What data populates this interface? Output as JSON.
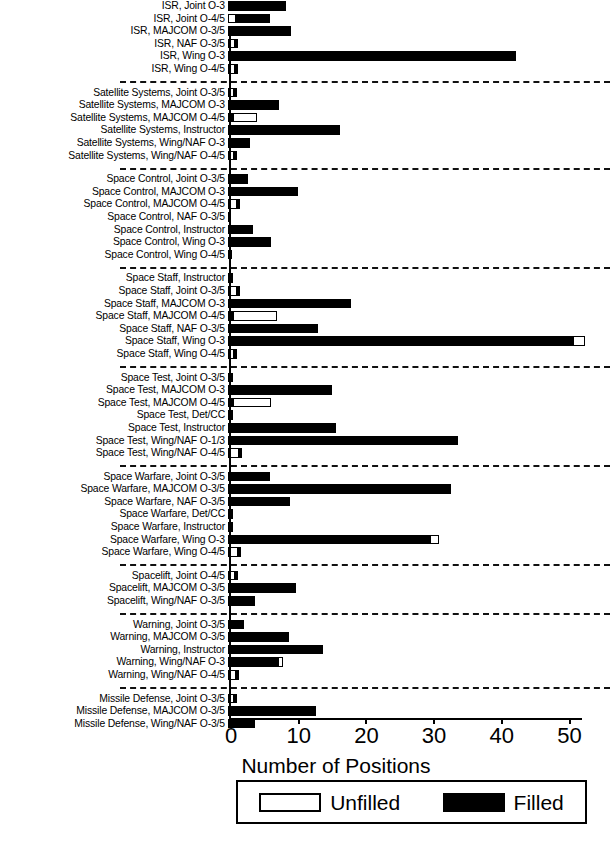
{
  "chart_data": {
    "type": "bar",
    "orientation": "horizontal",
    "stacked": true,
    "title": "",
    "xlabel": "Number of Positions",
    "ylabel": "",
    "xlim": [
      0,
      52
    ],
    "xticks": [
      0,
      10,
      20,
      30,
      40,
      50
    ],
    "xticklabels": [
      "0",
      "10",
      "20",
      "30",
      "40",
      "50"
    ],
    "grid": false,
    "legend": {
      "position": "bottom",
      "entries": [
        {
          "label": "Unfilled",
          "style": "unfilled",
          "color": "#ffffff",
          "edge": "#000000"
        },
        {
          "label": "Filled",
          "style": "filled",
          "color": "#000000",
          "edge": "#000000"
        }
      ]
    },
    "series": [
      {
        "name": "Unfilled",
        "style": "unfilled"
      },
      {
        "name": "Filled",
        "style": "filled"
      }
    ],
    "groups": [
      {
        "name": "ISR",
        "rows": [
          {
            "label": "ISR, Joint O-3",
            "unfilled": 0,
            "filled": 8.5
          },
          {
            "label": "ISR, Joint O-4/5",
            "unfilled": 1.2,
            "filled": 5.0
          },
          {
            "label": "ISR, MAJCOM O-3/5",
            "unfilled": 0,
            "filled": 9.3
          },
          {
            "label": "ISR, NAF O-3/5",
            "unfilled": 1.0,
            "filled": 0.5
          },
          {
            "label": "ISR, Wing O-3",
            "unfilled": 0,
            "filled": 42.5
          },
          {
            "label": "ISR, Wing O-4/5",
            "unfilled": 1.0,
            "filled": 0.4
          }
        ]
      },
      {
        "name": "Satellite Systems",
        "rows": [
          {
            "label": "Satellite Systems, Joint O-3/5",
            "unfilled": 0.9,
            "filled": 0.3
          },
          {
            "label": "Satellite Systems, MAJCOM O-3",
            "unfilled": 0,
            "filled": 7.6
          },
          {
            "label": "Satellite Systems, MAJCOM O-4/5",
            "unfilled": 0,
            "filled": 0.7,
            "trailing_unfilled": 3.6
          },
          {
            "label": "Satellite Systems, Instructor",
            "unfilled": 0,
            "filled": 16.6
          },
          {
            "label": "Satellite Systems, Wing/NAF O-3",
            "unfilled": 0,
            "filled": 3.2
          },
          {
            "label": "Satellite Systems, Wing/NAF O-4/5",
            "unfilled": 0.9,
            "filled": 0.3
          }
        ]
      },
      {
        "name": "Space Control",
        "rows": [
          {
            "label": "Space Control, Joint O-3/5",
            "unfilled": 0,
            "filled": 3.0
          },
          {
            "label": "Space Control, MAJCOM O-3",
            "unfilled": 0,
            "filled": 10.3
          },
          {
            "label": "Space Control, MAJCOM O-4/5",
            "unfilled": 1.3,
            "filled": 0.3
          },
          {
            "label": "Space Control, NAF O-3/5",
            "unfilled": 0,
            "filled": 0.5
          },
          {
            "label": "Space Control, Instructor",
            "unfilled": 0,
            "filled": 3.7
          },
          {
            "label": "Space Control, Wing O-3",
            "unfilled": 0,
            "filled": 6.3
          },
          {
            "label": "Space Control, Wing O-4/5",
            "unfilled": 0,
            "filled": 0.6
          }
        ]
      },
      {
        "name": "Space Staff",
        "rows": [
          {
            "label": "Space Staff, Instructor",
            "unfilled": 0,
            "filled": 0.7
          },
          {
            "label": "Space Staff, Joint O-3/5",
            "unfilled": 1.3,
            "filled": 0.3
          },
          {
            "label": "Space Staff, MAJCOM O-3",
            "unfilled": 0,
            "filled": 18.2
          },
          {
            "label": "Space Staff, MAJCOM O-4/5",
            "unfilled": 0,
            "filled": 0.7,
            "trailing_unfilled": 6.5
          },
          {
            "label": "Space Staff, NAF O-3/5",
            "unfilled": 0,
            "filled": 13.3
          },
          {
            "label": "Space Staff, Wing O-3",
            "unfilled": 0,
            "filled": 51.0,
            "trailing_unfilled": 1.8
          },
          {
            "label": "Space Staff, Wing O-4/5",
            "unfilled": 0.9,
            "filled": 0.3
          }
        ]
      },
      {
        "name": "Space Test",
        "rows": [
          {
            "label": "Space Test, Joint O-3/5",
            "unfilled": 0,
            "filled": 0.8
          },
          {
            "label": "Space Test, MAJCOM O-3",
            "unfilled": 0,
            "filled": 15.3
          },
          {
            "label": "Space Test, MAJCOM O-4/5",
            "unfilled": 0,
            "filled": 0.7,
            "trailing_unfilled": 5.6
          },
          {
            "label": "Space Test, Det/CC",
            "unfilled": 0,
            "filled": 0.8
          },
          {
            "label": "Space Test, Instructor",
            "unfilled": 0,
            "filled": 16.0
          },
          {
            "label": "Space Test, Wing/NAF O-1/3",
            "unfilled": 0,
            "filled": 34.0
          },
          {
            "label": "Space Test, Wing/NAF O-4/5",
            "unfilled": 1.6,
            "filled": 0.3
          }
        ]
      },
      {
        "name": "Space Warfare",
        "rows": [
          {
            "label": "Space Warfare, Joint O-3/5",
            "unfilled": 0,
            "filled": 6.2
          },
          {
            "label": "Space Warfare, MAJCOM O-3/5",
            "unfilled": 0,
            "filled": 33.0
          },
          {
            "label": "Space Warfare, NAF O-3/5",
            "unfilled": 0,
            "filled": 9.2
          },
          {
            "label": "Space Warfare, Det/CC",
            "unfilled": 0,
            "filled": 0.7
          },
          {
            "label": "Space Warfare, Instructor",
            "unfilled": 0,
            "filled": 0.7
          },
          {
            "label": "Space Warfare, Wing O-3",
            "unfilled": 0,
            "filled": 29.8,
            "trailing_unfilled": 1.4
          },
          {
            "label": "Space Warfare, Wing O-4/5",
            "unfilled": 1.5,
            "filled": 0.3
          }
        ]
      },
      {
        "name": "Spacelift",
        "rows": [
          {
            "label": "Spacelift, Joint O-4/5",
            "unfilled": 1.0,
            "filled": 0.3
          },
          {
            "label": "Spacelift, MAJCOM O-3/5",
            "unfilled": 0,
            "filled": 10.0
          },
          {
            "label": "Spacelift, Wing/NAF O-3/5",
            "unfilled": 0,
            "filled": 4.0
          }
        ]
      },
      {
        "name": "Warning",
        "rows": [
          {
            "label": "Warning, Joint O-3/5",
            "unfilled": 0,
            "filled": 2.4
          },
          {
            "label": "Warning, MAJCOM O-3/5",
            "unfilled": 0,
            "filled": 9.0
          },
          {
            "label": "Warning, Instructor",
            "unfilled": 0,
            "filled": 14.0
          },
          {
            "label": "Warning, Wing/NAF O-3",
            "unfilled": 0,
            "filled": 7.4,
            "trailing_unfilled": 0.7
          },
          {
            "label": "Warning, Wing/NAF O-4/5",
            "unfilled": 1.2,
            "filled": 0.3
          }
        ]
      },
      {
        "name": "Missile Defense",
        "rows": [
          {
            "label": "Missile Defense, Joint O-3/5",
            "unfilled": 0.9,
            "filled": 0.3
          },
          {
            "label": "Missile Defense, MAJCOM O-3/5",
            "unfilled": 0,
            "filled": 13.0
          },
          {
            "label": "Missile Defense, Wing/NAF O-3/5",
            "unfilled": 0,
            "filled": 4.0
          }
        ]
      }
    ]
  }
}
